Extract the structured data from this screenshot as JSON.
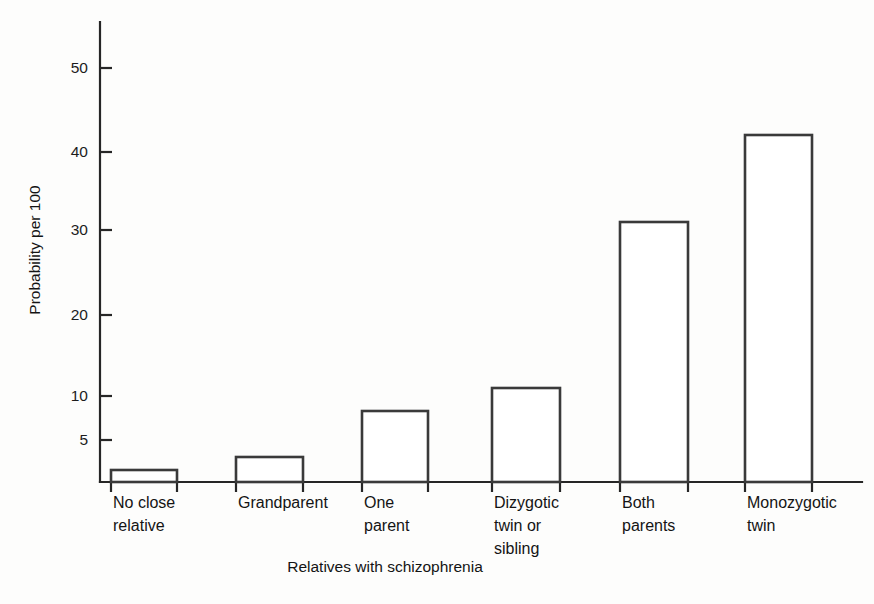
{
  "chart_data": {
    "type": "bar",
    "title": "",
    "subtitle": "",
    "xlabel": "Relatives with schizophrenia",
    "ylabel": "Probability per 100",
    "categories": [
      "No close relative",
      "Grandparent",
      "One parent",
      "Dizygotic twin or sibling",
      "Both parents",
      "Monozygotic twin"
    ],
    "category_lines": [
      [
        "No close",
        "relative"
      ],
      [
        "Grandparent"
      ],
      [
        "One",
        "parent"
      ],
      [
        "Dizygotic",
        "twin or",
        "sibling"
      ],
      [
        "Both",
        "parents"
      ],
      [
        "Monozygotic",
        "twin"
      ]
    ],
    "values": [
      2.5,
      3.4,
      8.0,
      11.2,
      31.5,
      42.0
    ],
    "ytick_labels": [
      "5",
      "10",
      "20",
      "30",
      "40",
      "50"
    ],
    "ytick_values": [
      5,
      10,
      20,
      30,
      40,
      50
    ],
    "ylim": [
      0,
      57
    ],
    "grid": false,
    "legend": "none",
    "legend_position": "none",
    "scale_note": "non-linear compressed low end",
    "series": [
      {
        "name": "Probability per 100",
        "values": [
          2.5,
          3.4,
          8.0,
          11.2,
          31.5,
          42.0
        ]
      }
    ]
  },
  "geometry": {
    "axis_x": 100,
    "axis_top": 22,
    "baseline_y": 482,
    "axis_right": 862,
    "tick_len": 12,
    "xtick_len": 10,
    "ytick_pixels": [
      440,
      396,
      315,
      230,
      152,
      68
    ],
    "bar_px": [
      {
        "x": 111,
        "w": 66,
        "top": 470
      },
      {
        "x": 236,
        "w": 67,
        "top": 457
      },
      {
        "x": 362,
        "w": 66,
        "top": 411
      },
      {
        "x": 492,
        "w": 68,
        "top": 388
      },
      {
        "x": 620,
        "w": 68,
        "top": 222
      },
      {
        "x": 745,
        "w": 67,
        "top": 135
      }
    ],
    "label_x": [
      113,
      238,
      364,
      494,
      622,
      747
    ],
    "label_y_first": 508,
    "label_line_height": 23,
    "xtitle_x": 385,
    "xtitle_y": 572,
    "ytitle_x": 40,
    "ytitle_y": 250
  },
  "colors": {
    "background": "#fdfdfc",
    "axis": "#262626",
    "bar_stroke": "#3a3a3a",
    "bar_fill": "#ffffff",
    "text": "#141414"
  }
}
